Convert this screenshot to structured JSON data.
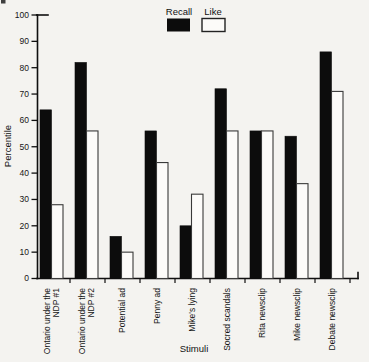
{
  "colors": {
    "background": "#f4f3f0",
    "bar_fill_recall": "#0c0c0c",
    "bar_fill_like": "#fcfbf9",
    "bar_outline": "#3a3a3a",
    "axis": "#0f0f0f"
  },
  "chart_data": {
    "type": "bar",
    "title": "",
    "xlabel": "Stimuli",
    "ylabel": "Percentile",
    "ylim": [
      0,
      100
    ],
    "ytick_step": 10,
    "grid": false,
    "legend_position": "top-center",
    "y_tick_labels": [
      "0",
      "10",
      "20",
      "30",
      "40",
      "50",
      "60",
      "70",
      "80",
      "90",
      "100"
    ],
    "categories": [
      "Ontario under the\nNDP #1",
      "Ontario under the\nNDP #2",
      "Potential ad",
      "Penny ad",
      "Mike's lying",
      "Socred scandals",
      "Rita newsclip",
      "Mike newsclip",
      "Debate newsclip"
    ],
    "series": [
      {
        "name": "Recall",
        "color": "#0c0c0c",
        "values": [
          64,
          82,
          16,
          56,
          20,
          72,
          56,
          54,
          86
        ]
      },
      {
        "name": "Like",
        "color": "#fcfbf9",
        "values": [
          28,
          56,
          10,
          44,
          32,
          56,
          56,
          36,
          71
        ]
      }
    ]
  }
}
